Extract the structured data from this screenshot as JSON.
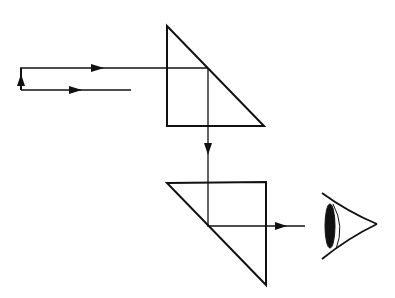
{
  "diagram": {
    "type": "optics-prism-periscope",
    "colors": {
      "stroke": "#111111",
      "background": "#ffffff"
    },
    "elements": [
      {
        "name": "incoming-ray-upper",
        "kind": "ray",
        "direction": "right"
      },
      {
        "name": "incoming-ray-lower",
        "kind": "ray",
        "direction": "right"
      },
      {
        "name": "upward-arrow",
        "kind": "ray",
        "direction": "up"
      },
      {
        "name": "upper-prism",
        "kind": "right-angle-prism"
      },
      {
        "name": "vertical-ray",
        "kind": "ray",
        "direction": "down"
      },
      {
        "name": "lower-prism",
        "kind": "right-angle-prism"
      },
      {
        "name": "outgoing-ray",
        "kind": "ray",
        "direction": "right"
      },
      {
        "name": "eye",
        "kind": "observer"
      }
    ]
  }
}
